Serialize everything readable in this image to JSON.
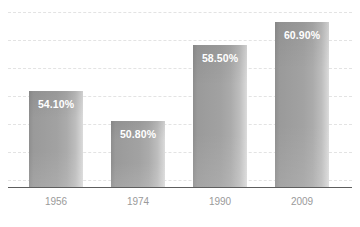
{
  "chart_data": {
    "type": "bar",
    "title": "",
    "subtitle": "",
    "xlabel": "",
    "ylabel": "",
    "categories": [
      "1956",
      "1974",
      "1990",
      "2009"
    ],
    "values": [
      54.1,
      50.8,
      58.5,
      60.9
    ],
    "value_labels": [
      "54.10%",
      "50.80%",
      "58.50%",
      "60.90%"
    ],
    "value_suffix": "%",
    "series": [
      {
        "name": "",
        "values": [
          54.1,
          50.8,
          58.5,
          60.9
        ]
      }
    ],
    "ylim": [
      0,
      62.5
    ],
    "grid": true,
    "grid_orientation": "horizontal",
    "grid_style": "dashed",
    "gridline_count": 7,
    "legend": false,
    "legend_position": "none",
    "axis_visible": "x-only",
    "bar_count": 4,
    "bar_label_position": "inside-top",
    "annotations": []
  },
  "style": {
    "background": "#ffffff",
    "bar_color_dark": "#8e8e8e",
    "bar_color_mid": "#a2a2a2",
    "bar_color_light": "#dcdcdc",
    "gridline_color": "#e3e3e3",
    "axis_color": "#5e5e5e",
    "value_label_color": "#ffffff",
    "category_label_color": "#9a9a9a"
  },
  "layout": {
    "bars": [
      {
        "left": 29,
        "width": 54,
        "top": 90,
        "height": 97
      },
      {
        "left": 111,
        "width": 54,
        "top": 120,
        "height": 67
      },
      {
        "left": 193,
        "width": 54,
        "top": 44,
        "height": 143
      },
      {
        "left": 275,
        "width": 54,
        "top": 21,
        "height": 166
      }
    ],
    "gridlines": [
      12,
      40,
      68,
      96,
      124,
      152,
      180
    ],
    "category_positions": [
      29,
      111,
      193,
      275
    ],
    "category_width": 54
  }
}
